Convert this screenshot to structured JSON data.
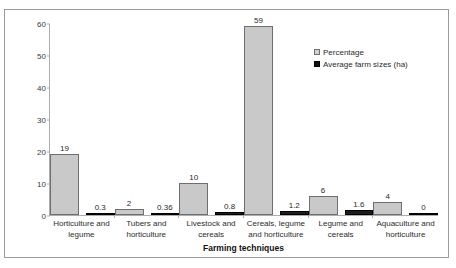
{
  "chart_data": {
    "type": "bar",
    "title": "",
    "xlabel": "Farming techniques",
    "ylabel": "Farm sizes and percentage",
    "ylim": [
      0,
      60
    ],
    "yticks": [
      0,
      10,
      20,
      30,
      40,
      50,
      60
    ],
    "grid": false,
    "legend_position": "top-right",
    "categories": [
      "Horticulture and legume",
      "Tubers and horticulture",
      "Livestock and cereals",
      "Cereals, legume and horticulture",
      "Legume and cereals",
      "Aquaculture and horticulture"
    ],
    "series": [
      {
        "name": "Percentage",
        "color": "#c9c9c9",
        "values": [
          19,
          2,
          10,
          59,
          6,
          4
        ],
        "labels": [
          "19",
          "2",
          "10",
          "59",
          "6",
          "4"
        ]
      },
      {
        "name": "Average farm sizes (ha)",
        "color": "#1c1c1c",
        "values": [
          0.3,
          0.36,
          0.8,
          1.2,
          1.6,
          0
        ],
        "labels": [
          "0.3",
          "0.36",
          "0.8",
          "1.2",
          "1.6",
          "0"
        ]
      }
    ]
  },
  "legend": {
    "items": [
      {
        "label": "Percentage"
      },
      {
        "label": "Average farm sizes (ha)"
      }
    ]
  },
  "axes": {
    "y_title": "Farm sizes and percentage",
    "x_title": "Farming techniques",
    "y_ticks": [
      "60",
      "50",
      "40",
      "30",
      "20",
      "10",
      "0"
    ]
  },
  "colors": {
    "series_percentage": "#c9c9c9",
    "series_farm_size": "#1c1c1c",
    "axis": "#adadad",
    "frame": "#9a9a9a",
    "background": "#ffffff"
  }
}
